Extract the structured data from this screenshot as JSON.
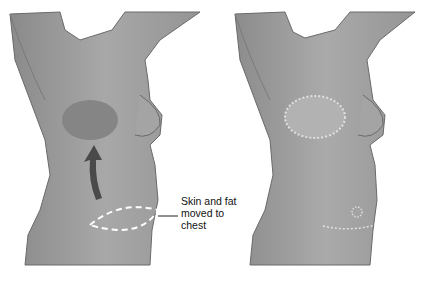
{
  "figure": {
    "panels": [
      {
        "id": "before",
        "description": "Torso before surgery with donor flap outlined on abdomen and arrow pointing to chest"
      },
      {
        "id": "after",
        "description": "Torso after surgery with flap sutured on chest and abdominal scar"
      }
    ],
    "annotation": {
      "lines": [
        "Skin and fat",
        "moved to",
        "chest"
      ]
    },
    "colors": {
      "skin": "#9a9a9a",
      "skin_light": "#b4b4b4",
      "outline": "#5a5a5a",
      "arrow": "#4a4a4a",
      "dashed": "#ffffff",
      "background": "#ffffff"
    }
  }
}
